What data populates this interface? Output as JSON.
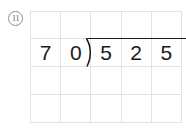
{
  "problem": {
    "number_label": "11",
    "icon": "circled-number",
    "expression": "525 ÷ 70",
    "divisor": "70",
    "dividend": "525"
  },
  "grid": {
    "columns": 5,
    "rows": 4,
    "line_color": "#e3e3e3",
    "cells": [
      [
        "",
        "",
        "",
        "",
        ""
      ],
      [
        "7",
        "0",
        "5",
        "2",
        "5"
      ],
      [
        "",
        "",
        "",
        "",
        ""
      ],
      [
        "",
        "",
        "",
        "",
        ""
      ]
    ]
  },
  "marks": {
    "division_bracket": "division-bracket",
    "division_bar": "division-bar",
    "ink_color": "#1a1a1a"
  }
}
